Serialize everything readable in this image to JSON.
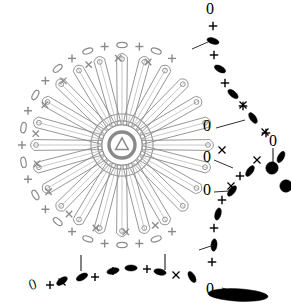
{
  "diagram": {
    "type": "crochet-stitch-chart",
    "width": 291,
    "height": 306,
    "background": "#ffffff",
    "colors": {
      "motif_gray": "#8a8a8a",
      "motif_gray_light": "#9a9a9a",
      "edge_black": "#000000",
      "leader_line": "#1a1a1a"
    },
    "symbols": {
      "chain": {
        "glyph": "0",
        "name": "chain-stitch-symbol",
        "meaning": "chain"
      },
      "single_crochet": {
        "glyph": "+",
        "name": "single-crochet-symbol",
        "meaning": "single crochet"
      },
      "single_crochet_x": {
        "glyph": "x",
        "name": "single-crochet-x-symbol",
        "meaning": "single crochet"
      },
      "oval_open": {
        "glyph": "oval-outline",
        "name": "chain-oval-symbol",
        "meaning": "chain loop"
      },
      "oval_filled": {
        "glyph": "oval-filled",
        "name": "slip-stitch-filled-symbol",
        "meaning": "slip stitch / bead"
      },
      "petal": {
        "glyph": "long-loop",
        "name": "petal-loop-symbol",
        "meaning": "long petal loop"
      },
      "ring": {
        "glyph": "triangle-in-ring",
        "name": "center-ring-symbol",
        "meaning": "magic ring start"
      },
      "tick": {
        "glyph": "|",
        "name": "tick-marker",
        "meaning": "row marker"
      }
    },
    "center": {
      "cx": 122,
      "cy": 145,
      "ring_radius": 13,
      "triangle": true
    },
    "petals": {
      "count": 24,
      "inner_radius": 20,
      "outer_radius": 88,
      "tip_dot_radius": 2.4
    },
    "rim": {
      "radius": 100,
      "arc_start_deg": 60,
      "arc_end_deg": 300,
      "pattern": [
        "+",
        "0"
      ]
    },
    "outer_black_arc": {
      "note": "black oval and plus symbols forming right-hand point",
      "count": 22
    },
    "leader_lines": 6,
    "tick_markers": 3
  }
}
